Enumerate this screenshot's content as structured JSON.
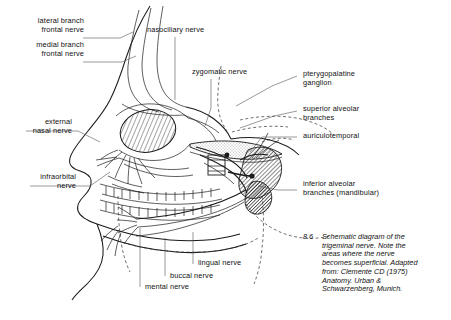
{
  "figure": {
    "number": "8.6",
    "caption": "Schematic diagram of the\ntrigeminal nerve. Note the\nareas where the nerve\nbecomes superficial. Adapted\nfrom: Clemente CD (1975)\nAnatomy. Urban &\nSchwarzenberg, Munich.",
    "background_color": "#ffffff",
    "ink_color": "#1a1a1a",
    "leader_color": "#555555"
  },
  "labels": {
    "lateral_branch_frontal_nerve": "lateral branch\nfrontal nerve",
    "medial_branch_frontal_nerve": "medial branch\nfrontal nerve",
    "nasociliary_nerve": "nasociliary nerve",
    "zygomatic_nerve": "zygomatic nerve",
    "pterygopalatine_ganglion": "pterygopalatine\nganglion",
    "superior_alveolar_branches": "superior alveolar\nbranches",
    "auriculotemporal": "auriculotemporal",
    "inferior_alveolar_branches": "inferior alveolar\nbranches (mandibular)",
    "external_nasal_nerve": "external\nnasal nerve",
    "infraorbital_nerve": "infraorbital\nnerve",
    "lingual_nerve": "lingual nerve",
    "buccal_nerve": "buccal nerve",
    "mental_nerve": "mental nerve"
  }
}
